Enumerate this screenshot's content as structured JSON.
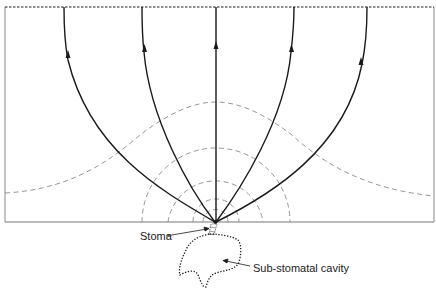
{
  "diagram": {
    "labels": {
      "stoma": "Stoma",
      "cavity": "Sub-stomatal cavity"
    },
    "flux_lines": {
      "count": 5,
      "direction": "upward",
      "origin": "stoma"
    },
    "contours": {
      "style": "dashed",
      "hemispherical_shells": 4,
      "outer_bell_curve": 1
    },
    "boundaries": {
      "top": "dashed boundary line",
      "bottom": "leaf surface"
    },
    "colors": {
      "flux_line": "#1a1a1a",
      "contour": "#8a8a8a",
      "frame": "#777777",
      "cavity_outline": "#1a1a1a"
    }
  }
}
